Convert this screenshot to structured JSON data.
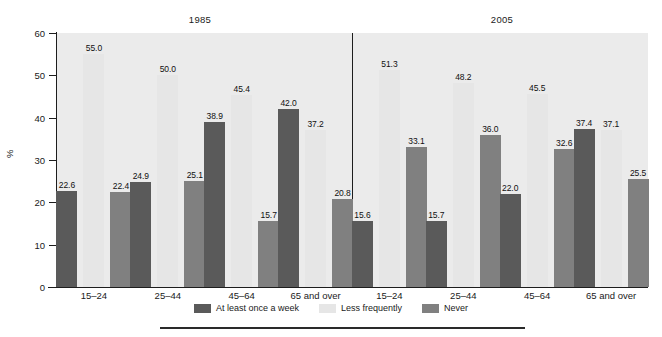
{
  "chart_data": {
    "type": "bar",
    "title": "",
    "xlabel": "",
    "ylabel": "%",
    "ylim": [
      0,
      60
    ],
    "yticks": [
      0,
      10,
      20,
      30,
      40,
      50,
      60
    ],
    "ytick_labels": [
      "0",
      "10",
      "20",
      "30",
      "40",
      "50",
      "60"
    ],
    "grid": false,
    "legend_position": "bottom-center",
    "panels": [
      {
        "title": "1985",
        "categories": [
          "15–24",
          "25–44",
          "45–64",
          "65 and over"
        ],
        "series": [
          {
            "name": "At least once a week",
            "color": "#5a5a5a",
            "values": [
              22.6,
              24.9,
              38.9,
              42.0
            ]
          },
          {
            "name": "Less frequently",
            "color": "#e6e6e6",
            "values": [
              55.0,
              50.0,
              45.4,
              37.2
            ]
          },
          {
            "name": "Never",
            "color": "#808080",
            "values": [
              22.4,
              25.1,
              15.7,
              20.8
            ]
          }
        ]
      },
      {
        "title": "2005",
        "categories": [
          "15–24",
          "25–44",
          "45–64",
          "65 and over"
        ],
        "series": [
          {
            "name": "At least once a week",
            "color": "#5a5a5a",
            "values": [
              15.6,
              15.7,
              22.0,
              37.4
            ]
          },
          {
            "name": "Less frequently",
            "color": "#e6e6e6",
            "values": [
              51.3,
              48.2,
              45.5,
              37.1
            ]
          },
          {
            "name": "Never",
            "color": "#808080",
            "values": [
              33.1,
              36.0,
              32.6,
              25.5
            ]
          }
        ]
      }
    ],
    "legend": [
      {
        "label": "At least once a week",
        "color": "#5a5a5a"
      },
      {
        "label": "Less frequently",
        "color": "#e6e6e6"
      },
      {
        "label": "Never",
        "color": "#808080"
      }
    ],
    "value_label_format": "one-decimal"
  }
}
